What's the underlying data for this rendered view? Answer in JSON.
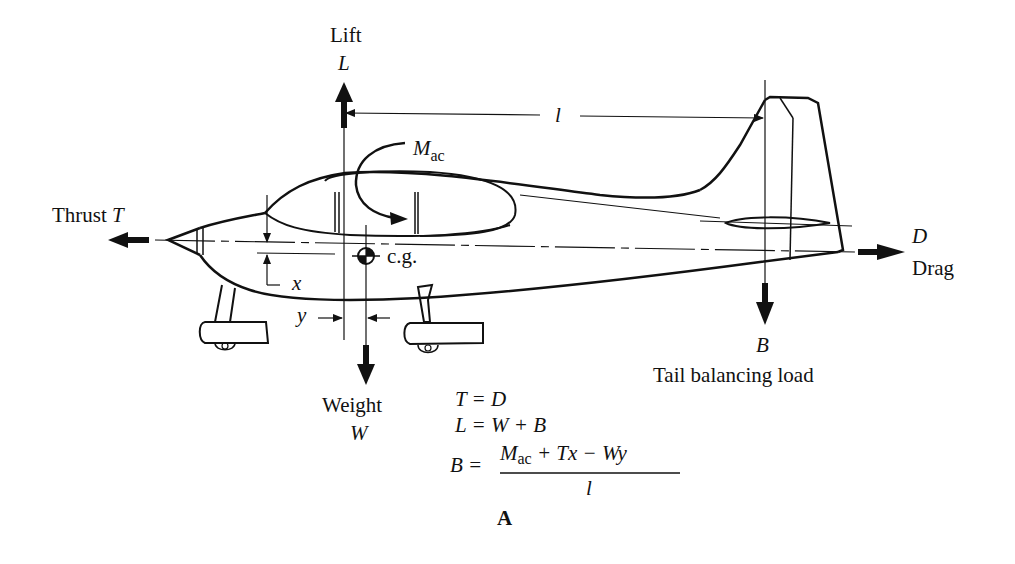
{
  "figure": {
    "caption_label": "A",
    "labels": {
      "lift_word": "Lift",
      "lift_symbol": "L",
      "moment_symbol": "M",
      "moment_subscript": "ac",
      "arm_symbol": "l",
      "thrust_word": "Thrust",
      "thrust_symbol": "T",
      "cg_label": "c.g.",
      "x_dim": "x",
      "y_dim": "y",
      "drag_symbol": "D",
      "drag_word": "Drag",
      "tail_symbol": "B",
      "tail_word": "Tail balancing load",
      "weight_word": "Weight",
      "weight_symbol": "W"
    },
    "equations": {
      "eq1": "T = D",
      "eq2": "L = W + B",
      "eq3_lhs": "B =",
      "eq3_num_M": "M",
      "eq3_num_sub": "ac",
      "eq3_num_rest": " + Tx − Wy",
      "eq3_den": "l"
    },
    "colors": {
      "ink": "#111111",
      "background": "#ffffff"
    }
  }
}
